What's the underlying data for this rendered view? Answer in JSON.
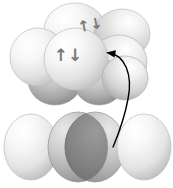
{
  "figure": {
    "name": "orbital-overlap-diagram",
    "background_color": "#ffffff",
    "width": 188,
    "height": 173
  },
  "palette": {
    "sphere_light": "#ffffff",
    "sphere_mid": "#e8e8e8",
    "sphere_edge": "#b9b9b9",
    "sphere_shadow": "#9a9a9a",
    "lobe_light": "#f2f2f2",
    "lobe_mid": "#cfcfcf",
    "lobe_dark": "#8c8c8c",
    "lens_dark": "#7f7f7f",
    "outline": "#9e9e9e",
    "leader_line": "#000000",
    "arrow_glyph": "#7a7a7a"
  },
  "spin_labels": [
    {
      "id": "spin-pair-upper",
      "glyph": "↑↓",
      "meaning": "paired-electron-spins",
      "x": 91,
      "y": 30,
      "font_size": 15,
      "rotation": -12
    },
    {
      "id": "spin-pair-lower",
      "glyph": "↑↓",
      "meaning": "paired-electron-spins",
      "x": 68,
      "y": 60,
      "font_size": 16,
      "rotation": 0
    }
  ],
  "top_cluster": {
    "name": "sphere-cluster",
    "count": 7,
    "spheres": [
      {
        "id": "sphere-back-top",
        "cx": 75,
        "cy": 30,
        "rx": 31,
        "ry": 27,
        "shade": "light"
      },
      {
        "id": "sphere-back-right",
        "cx": 122,
        "cy": 34,
        "rx": 28,
        "ry": 25,
        "shade": "light"
      },
      {
        "id": "sphere-left",
        "cx": 38,
        "cy": 57,
        "rx": 28,
        "ry": 29,
        "shade": "light"
      },
      {
        "id": "sphere-center",
        "cx": 76,
        "cy": 59,
        "rx": 32,
        "ry": 31,
        "shade": "light"
      },
      {
        "id": "sphere-right",
        "cx": 118,
        "cy": 62,
        "rx": 28,
        "ry": 27,
        "shade": "mid"
      },
      {
        "id": "sphere-front-left",
        "cx": 55,
        "cy": 80,
        "rx": 26,
        "ry": 24,
        "shade": "shadow"
      },
      {
        "id": "sphere-front-right",
        "cx": 99,
        "cy": 82,
        "rx": 25,
        "ry": 23,
        "shade": "shadow"
      }
    ]
  },
  "bottom_row": {
    "name": "orbital-lobe-row",
    "count": 3,
    "lobes": [
      {
        "id": "lobe-left",
        "cx": 31,
        "cy": 147,
        "rx": 27,
        "ry": 33,
        "shade": "light"
      },
      {
        "id": "lobe-center",
        "cx": 86,
        "cy": 147,
        "rx": 32,
        "ry": 36,
        "shade": "overlap"
      },
      {
        "id": "lobe-right",
        "cx": 144,
        "cy": 147,
        "rx": 27,
        "ry": 33,
        "shade": "light"
      }
    ],
    "overlap_lens": {
      "id": "central-overlap-lens",
      "cx": 86,
      "cy": 147,
      "rx": 13,
      "ry": 35,
      "color": "#7f7f7f"
    }
  },
  "leader": {
    "name": "callout-leader-arrow",
    "arrow_tip": {
      "x": 108,
      "y": 53
    },
    "path": "M 108 53 C 124 54, 133 74, 128 98 C 124 120, 118 134, 113 146",
    "stroke_width": 1.4,
    "color": "#000000",
    "has_arrowhead": true
  }
}
